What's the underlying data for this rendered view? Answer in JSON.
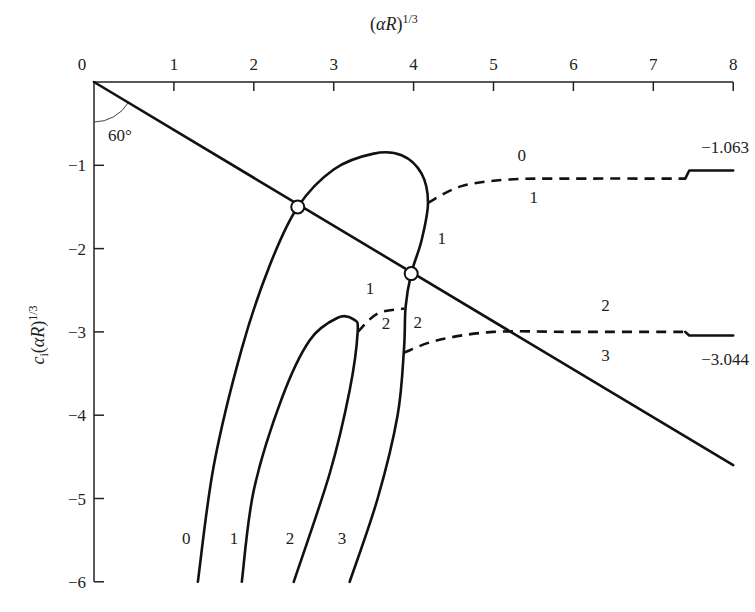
{
  "chart_data": {
    "type": "line",
    "title": "",
    "xlabel": "(αR)^1/3",
    "ylabel": "c_i(αR)^1/3",
    "xlim": [
      0,
      8
    ],
    "ylim": [
      -6,
      0
    ],
    "x_ticks": [
      "0",
      "1",
      "2",
      "3",
      "4",
      "5",
      "6",
      "7",
      "8"
    ],
    "y_ticks": [
      "0",
      "−1",
      "−2",
      "−3",
      "−4",
      "−5",
      "−6"
    ],
    "x_axis_position": "top",
    "grid": false,
    "angle_annotation": "60°",
    "series": [
      {
        "name": "boundary-line",
        "style": "solid",
        "points": [
          [
            0,
            0
          ],
          [
            8,
            -4.6
          ]
        ]
      },
      {
        "name": "outer-curve",
        "style": "solid",
        "points": [
          [
            1.3,
            -6
          ],
          [
            1.5,
            -4.6
          ],
          [
            1.85,
            -3.2
          ],
          [
            2.2,
            -2.2
          ],
          [
            2.55,
            -1.5
          ],
          [
            3.0,
            -1.05
          ],
          [
            3.5,
            -0.86
          ],
          [
            3.85,
            -0.88
          ],
          [
            4.1,
            -1.1
          ],
          [
            4.18,
            -1.45
          ],
          [
            4.1,
            -1.9
          ],
          [
            3.97,
            -2.3
          ],
          [
            3.9,
            -2.7
          ],
          [
            3.88,
            -3.2
          ],
          [
            3.8,
            -4.0
          ],
          [
            3.55,
            -5.0
          ],
          [
            3.2,
            -6
          ]
        ]
      },
      {
        "name": "inner-curve",
        "style": "solid",
        "points": [
          [
            1.85,
            -6
          ],
          [
            2.0,
            -4.9
          ],
          [
            2.35,
            -3.8
          ],
          [
            2.7,
            -3.1
          ],
          [
            3.05,
            -2.83
          ],
          [
            3.25,
            -2.85
          ],
          [
            3.3,
            -3.0
          ],
          [
            3.2,
            -3.7
          ],
          [
            2.95,
            -4.7
          ],
          [
            2.5,
            -6
          ]
        ]
      },
      {
        "name": "dashed-upper",
        "style": "dashed",
        "points": [
          [
            4.18,
            -1.45
          ],
          [
            4.6,
            -1.25
          ],
          [
            5.2,
            -1.17
          ],
          [
            6.0,
            -1.16
          ],
          [
            7.4,
            -1.16
          ]
        ]
      },
      {
        "name": "dashed-middle",
        "style": "dashed",
        "points": [
          [
            3.3,
            -3.0
          ],
          [
            3.55,
            -2.78
          ],
          [
            3.88,
            -2.72
          ]
        ]
      },
      {
        "name": "dashed-lower",
        "style": "dashed",
        "points": [
          [
            3.88,
            -3.25
          ],
          [
            4.3,
            -3.1
          ],
          [
            5.0,
            -3.0
          ],
          [
            6.0,
            -3.0
          ],
          [
            7.4,
            -3.0
          ]
        ]
      },
      {
        "name": "asymptote-upper",
        "style": "solid",
        "points": [
          [
            7.4,
            -1.16
          ],
          [
            7.45,
            -1.063
          ],
          [
            8.0,
            -1.063
          ]
        ]
      },
      {
        "name": "asymptote-lower",
        "style": "solid",
        "points": [
          [
            7.4,
            -3.0
          ],
          [
            7.45,
            -3.044
          ],
          [
            8.0,
            -3.044
          ]
        ]
      }
    ],
    "markers": [
      {
        "name": "intersection-1",
        "x": 2.55,
        "y": -1.5
      },
      {
        "name": "intersection-2",
        "x": 3.97,
        "y": -2.3
      }
    ],
    "annotations": [
      {
        "text": "−1.063",
        "x": 7.6,
        "y": -0.85
      },
      {
        "text": "−3.044",
        "x": 7.6,
        "y": -3.4
      },
      {
        "text": "0",
        "x": 5.3,
        "y": -0.95
      },
      {
        "text": "1",
        "x": 5.45,
        "y": -1.45
      },
      {
        "text": "1",
        "x": 4.3,
        "y": -1.95
      },
      {
        "text": "1",
        "x": 3.4,
        "y": -2.55
      },
      {
        "text": "2",
        "x": 3.6,
        "y": -2.97
      },
      {
        "text": "2",
        "x": 4.0,
        "y": -2.95
      },
      {
        "text": "2",
        "x": 6.35,
        "y": -2.75
      },
      {
        "text": "3",
        "x": 6.35,
        "y": -3.35
      },
      {
        "text": "0",
        "x": 1.1,
        "y": -5.55
      },
      {
        "text": "1",
        "x": 1.7,
        "y": -5.55
      },
      {
        "text": "2",
        "x": 2.4,
        "y": -5.55
      },
      {
        "text": "3",
        "x": 3.05,
        "y": -5.55
      }
    ]
  }
}
